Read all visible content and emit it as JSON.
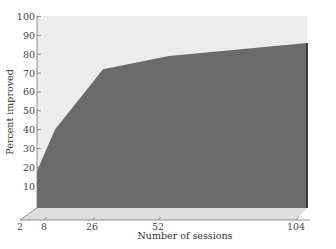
{
  "chart_data": {
    "type": "area",
    "title": "",
    "xlabel": "Number of sessions",
    "ylabel": "Percent improved",
    "x": [
      2,
      8,
      26,
      52,
      104
    ],
    "series": [
      {
        "name": "Percent improved",
        "values": [
          18,
          40,
          72,
          79,
          86
        ]
      }
    ],
    "x_tick_labels": [
      "2",
      "8",
      "26",
      "52",
      "104"
    ],
    "y_tick_labels": [
      "10",
      "20",
      "30",
      "40",
      "50",
      "60",
      "70",
      "80",
      "90",
      "100"
    ],
    "ylim": [
      0,
      100
    ],
    "xlim": [
      2,
      104
    ],
    "grid": false,
    "legend": "none",
    "style": "3d-area",
    "colors": {
      "area": "#6b6b6b",
      "back_plane": "#ececec",
      "floor": "#dcdcdc",
      "edge": "#3a3a3a"
    }
  }
}
